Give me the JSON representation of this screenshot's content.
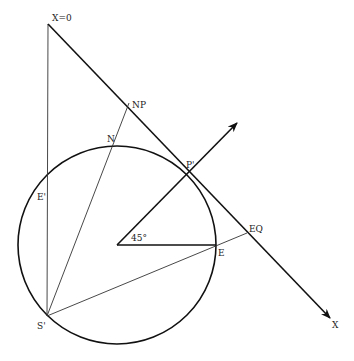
{
  "diagram": {
    "type": "geometric-construction",
    "circle": {
      "cx": 117,
      "cy": 245,
      "r": 99
    },
    "labels": {
      "x0": "X=0",
      "np": "NP",
      "n": "N",
      "p_prime": "P'",
      "e_prime": "E'",
      "eq": "EQ",
      "e": "E",
      "s_prime": "S'",
      "x": "X",
      "angle": "45°"
    },
    "points": {
      "X0": [
        48,
        24
      ],
      "NP": [
        129,
        103
      ],
      "N": [
        113,
        143
      ],
      "P_prime": [
        187,
        172
      ],
      "E_prime": [
        47,
        196
      ],
      "EQ": [
        247,
        233
      ],
      "E": [
        216,
        245
      ],
      "S_prime": [
        47,
        316
      ],
      "X_end": [
        330,
        318
      ],
      "center": [
        117,
        245
      ],
      "ray_end": [
        237,
        123
      ]
    },
    "colors": {
      "ink": "#111111",
      "background": "#ffffff"
    }
  }
}
